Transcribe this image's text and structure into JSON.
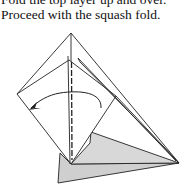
{
  "caption": {
    "line1": "Fold the top layer up and over.",
    "line2": "Proceed with the squash fold."
  },
  "diagram": {
    "colors": {
      "line": "#222222",
      "shade": "#cfcfcf",
      "background": "#ffffff"
    },
    "arrow": "curved fold arrow pointing left"
  }
}
